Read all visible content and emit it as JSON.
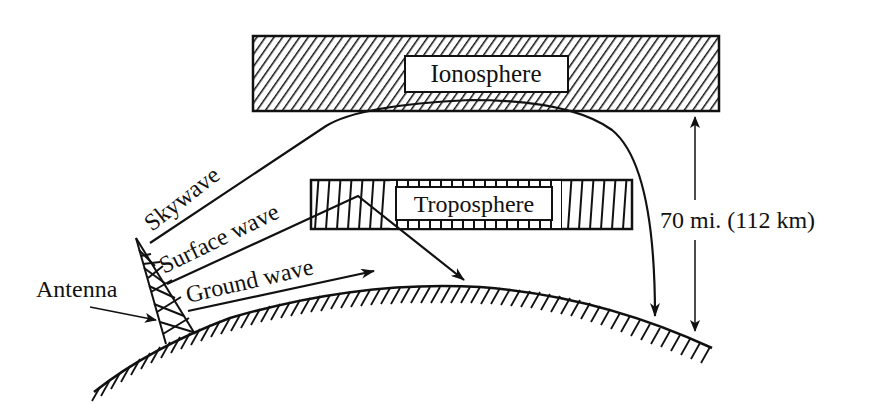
{
  "diagram": {
    "type": "radio-wave-propagation",
    "colors": {
      "ink": "#111111",
      "background": "#ffffff"
    },
    "layers": [
      {
        "id": "ionosphere",
        "label": "Ionosphere",
        "hatch": "diagonal"
      },
      {
        "id": "troposphere",
        "label": "Troposphere",
        "hatch": "vertical"
      }
    ],
    "waves": [
      {
        "id": "skywave",
        "label": "Skywave"
      },
      {
        "id": "surface-wave",
        "label": "Surface wave"
      },
      {
        "id": "ground-wave",
        "label": "Ground wave"
      }
    ],
    "antenna": {
      "label": "Antenna"
    },
    "dimension": {
      "label": "70 mi. (112 km)"
    }
  }
}
